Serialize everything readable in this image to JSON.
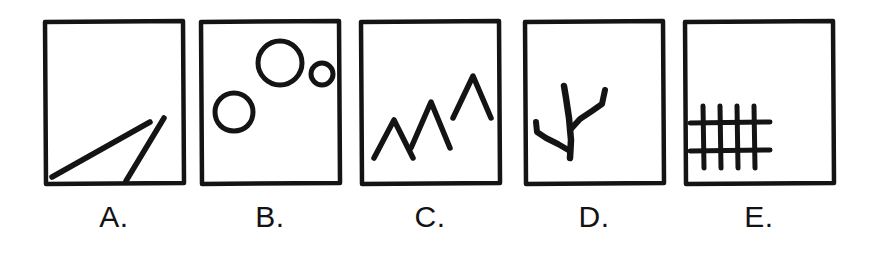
{
  "figure": {
    "type": "multiple-choice-sketch-panels",
    "background_color": "#ffffff",
    "ink_color": "#141414",
    "panel_count": 5,
    "width": 876,
    "height": 259
  },
  "panels": [
    {
      "id": "A",
      "label": "A.",
      "label_text": "A.",
      "content_name": "two-diagonal-lines",
      "content_description": "Two straight diagonal strokes rising to the right from the bottom edge, forming a narrow open V",
      "box": {
        "x": 42,
        "y": 18,
        "width": 144,
        "height": 168
      },
      "shapes": [
        {
          "kind": "line",
          "x1": 10,
          "y1": 158,
          "x2": 108,
          "y2": 104,
          "stroke_width": 5
        },
        {
          "kind": "line",
          "x1": 84,
          "y1": 162,
          "x2": 122,
          "y2": 100,
          "stroke_width": 5
        }
      ]
    },
    {
      "id": "B",
      "label": "B.",
      "label_text": "B.",
      "content_name": "three-circles",
      "content_description": "Three hand-drawn open circles of decreasing size arranged diagonally",
      "box": {
        "x": 198,
        "y": 18,
        "width": 144,
        "height": 168
      },
      "shapes": [
        {
          "kind": "circle",
          "cx": 36,
          "cy": 94,
          "r": 19,
          "stroke_width": 5
        },
        {
          "kind": "circle",
          "cx": 82,
          "cy": 45,
          "r": 22,
          "stroke_width": 5
        },
        {
          "kind": "circle",
          "cx": 124,
          "cy": 56,
          "r": 11,
          "stroke_width": 5
        }
      ]
    },
    {
      "id": "C",
      "label": "C.",
      "label_text": "C.",
      "content_name": "three-chevrons",
      "content_description": "Three caret or chevron marks of increasing height, like small peaks",
      "box": {
        "x": 358,
        "y": 18,
        "width": 144,
        "height": 168
      },
      "shapes": [
        {
          "kind": "chevron",
          "apex_x": 36,
          "apex_y": 102,
          "half_width": 20,
          "height": 38,
          "stroke_width": 5
        },
        {
          "kind": "chevron",
          "apex_x": 72,
          "apex_y": 84,
          "half_width": 20,
          "height": 46,
          "stroke_width": 5
        },
        {
          "kind": "chevron",
          "apex_x": 114,
          "apex_y": 58,
          "half_width": 20,
          "height": 42,
          "stroke_width": 5
        }
      ]
    },
    {
      "id": "D",
      "label": "D.",
      "label_text": "D.",
      "content_name": "branching-twig",
      "content_description": "A forked twig or branch shape with a vertical stem and two side branches",
      "box": {
        "x": 522,
        "y": 18,
        "width": 144,
        "height": 168
      },
      "shapes": [
        {
          "kind": "path",
          "role": "main-stem",
          "stroke_width": 6
        },
        {
          "kind": "path",
          "role": "right-branch",
          "stroke_width": 6
        },
        {
          "kind": "path",
          "role": "left-branch",
          "stroke_width": 6
        }
      ]
    },
    {
      "id": "E",
      "label": "E.",
      "label_text": "E.",
      "content_name": "crosshatch-grid",
      "content_description": "A tic-tac-toe like grid of four vertical lines crossed by two horizontal lines",
      "box": {
        "x": 682,
        "y": 18,
        "width": 154,
        "height": 168
      },
      "shapes": [
        {
          "kind": "line",
          "orientation": "vertical",
          "x": 18,
          "y1": 88,
          "y2": 148,
          "stroke_width": 5
        },
        {
          "kind": "line",
          "orientation": "vertical",
          "x": 34,
          "y1": 88,
          "y2": 148,
          "stroke_width": 5
        },
        {
          "kind": "line",
          "orientation": "vertical",
          "x": 50,
          "y1": 88,
          "y2": 148,
          "stroke_width": 5
        },
        {
          "kind": "line",
          "orientation": "vertical",
          "x": 66,
          "y1": 88,
          "y2": 148,
          "stroke_width": 5
        },
        {
          "kind": "line",
          "orientation": "horizontal",
          "y": 104,
          "x1": 6,
          "x2": 82,
          "stroke_width": 5
        },
        {
          "kind": "line",
          "orientation": "horizontal",
          "y": 132,
          "x1": 6,
          "x2": 82,
          "stroke_width": 5
        }
      ]
    }
  ]
}
